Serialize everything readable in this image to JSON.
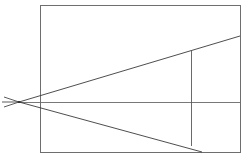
{
  "figure": {
    "background_color": "#ffffff",
    "line_color": "#3a3a3a",
    "frame_color": "#6e6e6e",
    "axis_color": "#6a6a6a",
    "canvas": {
      "width": 248,
      "height": 160
    }
  },
  "chart_data": {
    "type": "line",
    "subtitle": "",
    "xlabel": "",
    "ylabel": "",
    "grid": false,
    "legend": "none",
    "xlim": [
      0,
      248
    ],
    "ylim": [
      0,
      160
    ],
    "annotations": [],
    "tick_labels": {
      "x": [],
      "y": []
    },
    "series": [
      {
        "name": "frame-rectangle",
        "kind": "rectangle",
        "x": 40,
        "y": 5,
        "width": 200,
        "height": 147,
        "points": [
          [
            40,
            5
          ],
          [
            240,
            5
          ],
          [
            240,
            152
          ],
          [
            40,
            152
          ],
          [
            40,
            5
          ]
        ]
      },
      {
        "name": "upper-ray",
        "kind": "line",
        "points": [
          [
            19,
            102
          ],
          [
            240,
            36
          ]
        ]
      },
      {
        "name": "lower-ray",
        "kind": "line",
        "points": [
          [
            19,
            102
          ],
          [
            202,
            152
          ]
        ]
      },
      {
        "name": "center-axis",
        "kind": "line",
        "points": [
          [
            19,
            102
          ],
          [
            240,
            102
          ]
        ]
      },
      {
        "name": "inner-vertical",
        "kind": "line",
        "points": [
          [
            191,
            50
          ],
          [
            191,
            146
          ]
        ]
      },
      {
        "name": "apex-tail-upper",
        "kind": "line",
        "points": [
          [
            19,
            102
          ],
          [
            4,
            97
          ]
        ]
      },
      {
        "name": "apex-tail-lower",
        "kind": "line",
        "points": [
          [
            19,
            102
          ],
          [
            4,
            107
          ]
        ]
      },
      {
        "name": "apex-tail-axis",
        "kind": "line",
        "points": [
          [
            19,
            102
          ],
          [
            2,
            102
          ]
        ]
      }
    ],
    "apex": {
      "x": 19,
      "y": 102
    }
  }
}
